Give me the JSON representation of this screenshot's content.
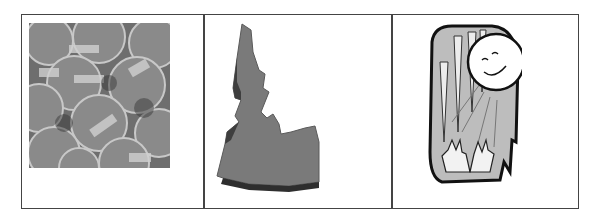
{
  "cells": [
    {
      "image": "pennies-photo",
      "alt": "pile of pennies"
    },
    {
      "image": "idaho-state-shape",
      "alt": "3D Idaho state shape"
    },
    {
      "image": "sun-icicles-hands-drawing",
      "alt": "smiling sun melting icicles over hands"
    }
  ]
}
